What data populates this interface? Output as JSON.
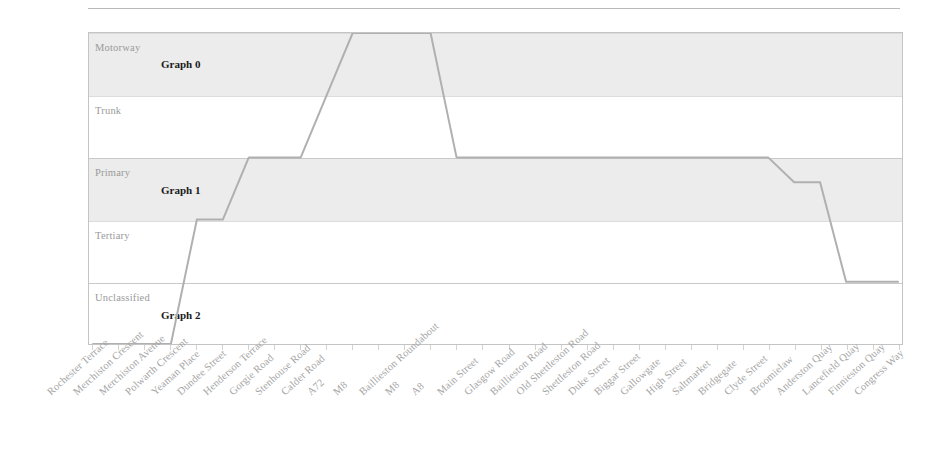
{
  "chart_data": {
    "type": "line",
    "title": "",
    "subtitle": "",
    "xlabel": "",
    "ylabel": "",
    "grid": true,
    "legend": "none",
    "step_style": "linear-interpolated",
    "y_categories": [
      "Motorway",
      "Trunk",
      "Primary",
      "Tertiary",
      "Unclassified",
      "Residential"
    ],
    "y_values": [
      5,
      4,
      3,
      2,
      1,
      0
    ],
    "ylim": [
      0,
      5
    ],
    "categories": [
      "Rochester Terrace",
      "Merchiston Crescent",
      "Merchiston Avenue",
      "Polwarth Crescent",
      "Yeaman Place",
      "Dundee Street",
      "Henderson Terrace",
      "Gorgie Road",
      "Stenhouse Road",
      "Calder Road",
      "A72",
      "M8",
      "Baillieston Roundabout",
      "M8",
      "A8",
      "Main Street",
      "Glasgow Road",
      "Baillieston Road",
      "Old Shettleston Road",
      "Shettleston Road",
      "Duke Street",
      "Biggar Street",
      "Gallowgate",
      "High Street",
      "Saltmarket",
      "Bridgegate",
      "Clyde Street",
      "Broomielaw",
      "Anderston Quay",
      "Lancefield Quay",
      "Finnieston Quay",
      "Congress Way"
    ],
    "values": [
      0,
      0,
      0,
      0,
      2,
      2,
      3,
      3,
      3,
      4,
      5,
      5,
      5,
      5,
      3,
      3,
      3,
      3,
      3,
      3,
      3,
      3,
      3,
      3,
      3,
      3,
      3,
      2.6,
      2.6,
      1,
      1,
      1
    ],
    "series": [
      {
        "name": "road-classification",
        "color": "#b0b0b0",
        "values": [
          0,
          0,
          0,
          0,
          2,
          2,
          3,
          3,
          3,
          4,
          5,
          5,
          5,
          5,
          3,
          3,
          3,
          3,
          3,
          3,
          3,
          3,
          3,
          3,
          3,
          3,
          3,
          2.6,
          2.6,
          1,
          1,
          1
        ]
      }
    ],
    "bands": [
      {
        "label": "Graph 0",
        "from": "Trunk",
        "to": "Motorway",
        "y_from": 4,
        "y_to": 5,
        "fill": "#ececec"
      },
      {
        "label": "Graph 1",
        "from": "Tertiary",
        "to": "Primary",
        "y_from": 2,
        "y_to": 3,
        "fill": "#ececec"
      },
      {
        "label": "Graph 2",
        "from": "Residential",
        "to": "Unclassified",
        "y_from": 0,
        "y_to": 1,
        "fill": "#ffffff"
      }
    ],
    "region_labels": [
      "Graph 0",
      "Graph 1",
      "Graph 2"
    ]
  },
  "axis": {
    "y_ticks": [
      {
        "label": "Motorway",
        "value": 5
      },
      {
        "label": "Trunk",
        "value": 4
      },
      {
        "label": "Primary",
        "value": 3
      },
      {
        "label": "Tertiary",
        "value": 2
      },
      {
        "label": "Unclassified",
        "value": 1
      },
      {
        "label": "Residential",
        "value": 0
      }
    ]
  },
  "style": {
    "line_color": "#b0b0b0",
    "band_color": "#ececec",
    "grid_color": "#dcdcdc",
    "frame_color": "#c4c4c4",
    "ylabel_color": "#9a9a9a",
    "xlabel_color": "#a6a6a6",
    "region_label_color": "#1a1a1a",
    "background": "#ffffff"
  }
}
